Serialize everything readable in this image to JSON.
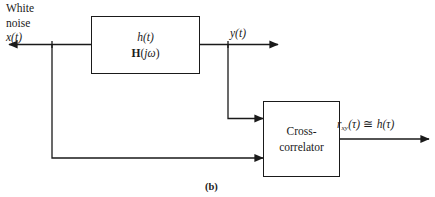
{
  "figure": {
    "caption": "(b)",
    "source_label_white_noise_line1": "White",
    "source_label_white_noise_line2": "noise"
  },
  "signals": {
    "input": {
      "name": "x",
      "arg": "(t)",
      "full": "x(t)"
    },
    "output": {
      "name": "y",
      "arg": "(t)",
      "full": "y(t)"
    },
    "result": {
      "name": "r",
      "subscript": "xy",
      "arg": "(τ)",
      "relation": "≅",
      "rhs_name": "h",
      "rhs_arg": "(τ)",
      "full": "r_xy(τ) ≅ h(τ)"
    }
  },
  "blocks": {
    "filter": {
      "impulse_response": "h(t)",
      "impulse_response_name": "h",
      "impulse_response_arg": "(t)",
      "transfer_function_name": "H",
      "transfer_function_arg_j": "j",
      "transfer_function_arg_w": "ω",
      "transfer_function": "H(jω)"
    },
    "crosscorrelator": {
      "line1": "Cross-",
      "line2": "correlator",
      "full": "Cross-correlator"
    }
  },
  "colors": {
    "stroke": "#1a1a1a",
    "background": "#ffffff",
    "text": "#1a1a1a"
  }
}
